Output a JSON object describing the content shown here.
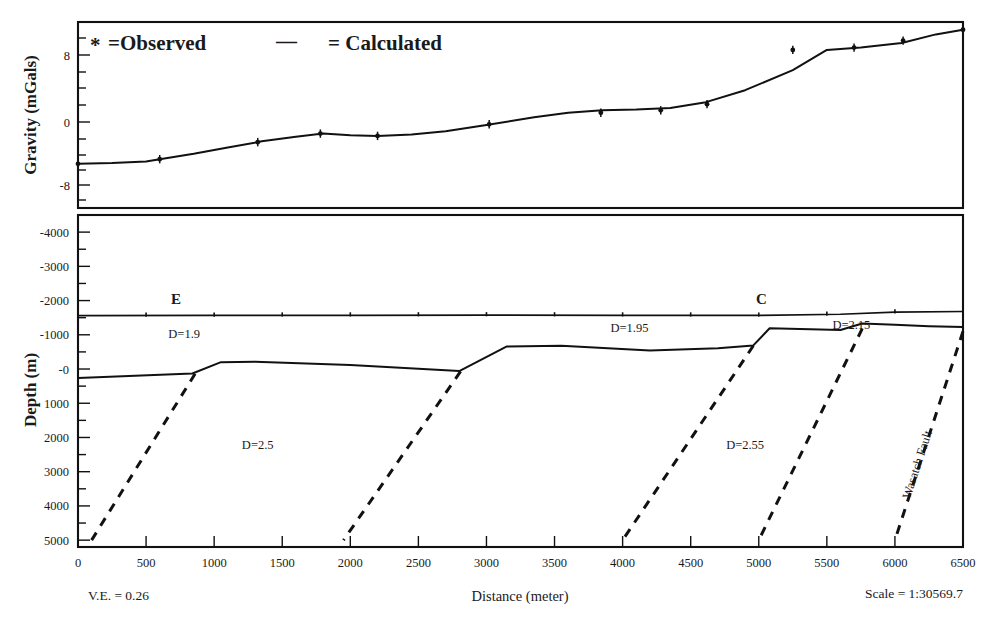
{
  "figure": {
    "legend": {
      "observed_marker": "*",
      "observed_label": "=Observed",
      "calculated_marker": "—",
      "calculated_label": "= Calculated"
    },
    "footer": {
      "vertical_exaggeration": "V.E. = 0.26",
      "xlabel": "Distance (meter)",
      "scale": "Scale = 1:30569.7"
    }
  },
  "chart_data": [
    {
      "type": "line",
      "title": "Gravity profile",
      "xlabel": "Distance (meter)",
      "ylabel": "Gravity (mGals)",
      "xlim": [
        0,
        6500
      ],
      "ylim": [
        -12,
        12
      ],
      "yticks": [
        8,
        0,
        -8
      ],
      "ytick_labels": [
        "8",
        "0",
        "-8"
      ],
      "grid": false,
      "legend_position": "top-left",
      "series": [
        {
          "name": "Calculated",
          "style": "line",
          "x": [
            0,
            250,
            500,
            600,
            850,
            1100,
            1350,
            1600,
            1800,
            2000,
            2200,
            2450,
            2700,
            3000,
            3350,
            3600,
            3850,
            4100,
            4350,
            4600,
            4900,
            5250,
            5500,
            5750,
            6050,
            6300,
            6500
          ],
          "y": [
            -6.3,
            -6.2,
            -6.0,
            -5.7,
            -5.0,
            -4.2,
            -3.4,
            -2.8,
            -2.4,
            -2.6,
            -2.7,
            -2.5,
            -2.1,
            -1.3,
            -0.3,
            0.3,
            0.6,
            0.7,
            0.9,
            1.6,
            3.2,
            5.8,
            8.4,
            8.7,
            9.3,
            10.4,
            11.0
          ]
        },
        {
          "name": "Observed",
          "style": "points",
          "x": [
            0,
            600,
            1320,
            1780,
            2200,
            3020,
            3840,
            4280,
            4620,
            5250,
            5700,
            6060,
            6500
          ],
          "y": [
            -6.3,
            -5.7,
            -3.5,
            -2.4,
            -2.7,
            -1.2,
            0.3,
            0.6,
            1.4,
            8.4,
            8.7,
            9.6,
            11.0
          ]
        }
      ]
    },
    {
      "type": "line",
      "title": "Geologic cross-section",
      "xlabel": "Distance (meter)",
      "ylabel": "Depth (m)",
      "xlim": [
        0,
        6500
      ],
      "ylim": [
        -4500,
        5200
      ],
      "xticks": [
        0,
        500,
        1000,
        1500,
        2000,
        2500,
        3000,
        3500,
        4000,
        4500,
        5000,
        5500,
        6000,
        6500
      ],
      "xtick_labels": [
        "0",
        "500",
        "1000",
        "1500",
        "2000",
        "2500",
        "3000",
        "3500",
        "4000",
        "4500",
        "5000",
        "5500",
        "6000",
        "6500"
      ],
      "yticks": [
        -4000,
        -3000,
        -2000,
        -1000,
        0,
        1000,
        2000,
        3000,
        4000,
        5000
      ],
      "ytick_labels": [
        "-4000",
        "-3000",
        "-2000",
        "-1000",
        "-0",
        "1000",
        "2000",
        "3000",
        "4000",
        "5000"
      ],
      "grid": false,
      "surface_profile": {
        "name": "Topographic surface",
        "x": [
          0,
          1000,
          2000,
          3000,
          4000,
          5000,
          5600,
          6000,
          6500
        ],
        "y": [
          -1560,
          -1565,
          -1570,
          -1575,
          -1570,
          -1565,
          -1600,
          -1660,
          -1680
        ]
      },
      "basement_horizon": {
        "name": "Basin / basement contact",
        "x": [
          0,
          840,
          1050,
          1300,
          2000,
          2800,
          3150,
          3550,
          4200,
          4700,
          4960,
          5080,
          5600,
          5760,
          6000,
          6250,
          6500
        ],
        "y": [
          260,
          130,
          -200,
          -210,
          -120,
          60,
          -660,
          -680,
          -540,
          -610,
          -690,
          -1190,
          -1140,
          -1330,
          -1290,
          -1250,
          -1230
        ]
      },
      "faults": [
        {
          "name": "fault-1",
          "x_top": 860,
          "y_top": 140,
          "x_bottom": 100,
          "y_bottom": 5000,
          "dashed": true
        },
        {
          "name": "fault-2",
          "x_top": 2810,
          "y_top": 70,
          "x_bottom": 1950,
          "y_bottom": 5000,
          "dashed": true
        },
        {
          "name": "fault-3",
          "x_top": 4960,
          "y_top": -680,
          "x_bottom": 4000,
          "y_bottom": 5000,
          "dashed": true
        },
        {
          "name": "fault-4",
          "x_top": 5760,
          "y_top": -1180,
          "x_bottom": 5000,
          "y_bottom": 5000,
          "dashed": true
        },
        {
          "name": "wasatch-fault",
          "x_top": 6500,
          "y_top": -1100,
          "x_bottom": 6000,
          "y_bottom": 5000,
          "dashed": true,
          "label": "Wasatch Fault"
        }
      ],
      "density_labels": [
        {
          "text": "D=1.9",
          "x": 780,
          "y": -900
        },
        {
          "text": "D=2.5",
          "x": 1320,
          "y": 2350
        },
        {
          "text": "D=1.95",
          "x": 4050,
          "y": -1090
        },
        {
          "text": "D=2.15",
          "x": 5680,
          "y": -1170
        },
        {
          "text": "D=2.55",
          "x": 4900,
          "y": 2350
        }
      ],
      "station_markers": [
        {
          "label": "E",
          "x": 720
        },
        {
          "label": "C",
          "x": 5020
        }
      ]
    }
  ]
}
